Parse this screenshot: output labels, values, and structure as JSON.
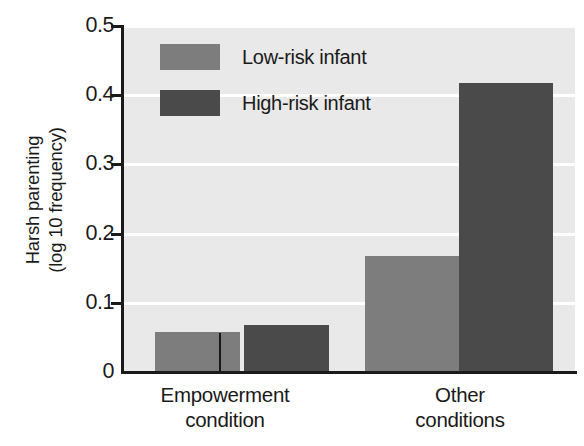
{
  "chart_data": {
    "type": "bar",
    "title": "",
    "xlabel": "",
    "ylabel": "Harsh parenting (log 10 frequency)",
    "ylabel_lines": [
      "Harsh parenting",
      "(log 10 frequency)"
    ],
    "categories": [
      "Empowerment condition",
      "Other conditions"
    ],
    "category_lines": [
      [
        "Empowerment",
        "condition"
      ],
      [
        "Other",
        "conditions"
      ]
    ],
    "series": [
      {
        "name": "Low-risk infant",
        "values": [
          0.057,
          0.167
        ],
        "color": "#7d7d7d"
      },
      {
        "name": "High-risk infant",
        "values": [
          0.068,
          0.417
        ],
        "color": "#4a4a4a"
      }
    ],
    "ylim": [
      0,
      0.5
    ],
    "yticks": [
      0,
      0.1,
      0.2,
      0.3,
      0.4,
      0.5
    ],
    "ytick_labels": [
      "0",
      "0.1",
      "0.2",
      "0.3",
      "0.4",
      "0.5"
    ],
    "grid": "horizontal-white",
    "legend_position": "upper-left-inside",
    "plot_background": "#e9e9e9",
    "axis_color": "#1a1a1a"
  },
  "legend": {
    "items": [
      {
        "label": "Low-risk infant",
        "color": "#7d7d7d"
      },
      {
        "label": "High-risk infant",
        "color": "#4a4a4a"
      }
    ]
  },
  "axes": {
    "y_title_line1": "Harsh parenting",
    "y_title_line2": "(log 10 frequency)",
    "y_labels": [
      "0.5",
      "0.4",
      "0.3",
      "0.2",
      "0.1",
      "0"
    ],
    "x_group1_line1": "Empowerment",
    "x_group1_line2": "condition",
    "x_group2_line1": "Other",
    "x_group2_line2": "conditions"
  }
}
